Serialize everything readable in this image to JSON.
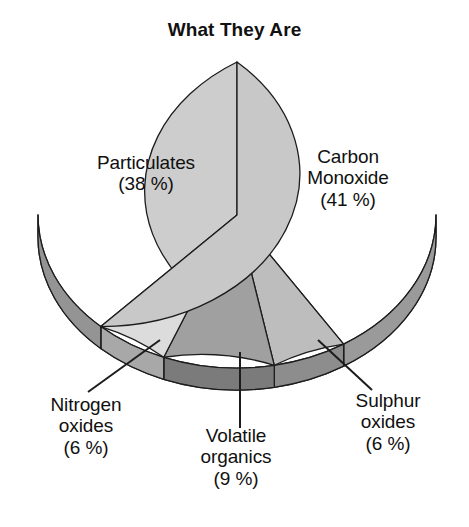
{
  "chart_data": {
    "type": "pie",
    "title": "What They Are",
    "xlabel": "",
    "ylabel": "",
    "legend_position": "none",
    "grid": false,
    "three_d": true,
    "start_angle_deg": 90,
    "direction": "clockwise",
    "categories": [
      "Carbon Monoxide",
      "Sulphur oxides",
      "Volatile organics",
      "Nitrogen oxides",
      "Particulates"
    ],
    "values": [
      41,
      6,
      9,
      6,
      38
    ],
    "value_unit": "%",
    "slices": [
      {
        "name": "Carbon Monoxide",
        "label_lines": "Carbon\nMonoxide\n(41 %)",
        "value": 41,
        "percent_text": "(41 %)",
        "top_color": "#cdcdcd",
        "side_color": "#9a9a9a",
        "label_placement": "inside"
      },
      {
        "name": "Sulphur oxides",
        "label_lines": "Sulphur\noxides\n(6 %)",
        "value": 6,
        "percent_text": "(6 %)",
        "top_color": "#bdbdbd",
        "side_color": "#8d8d8d",
        "label_placement": "outside-leader"
      },
      {
        "name": "Volatile organics",
        "label_lines": "Volatile\norganics\n(9 %)",
        "value": 9,
        "percent_text": "(9 %)",
        "top_color": "#a0a0a0",
        "side_color": "#7b7b7b",
        "label_placement": "outside-leader"
      },
      {
        "name": "Nitrogen oxides",
        "label_lines": "Nitrogen\noxides\n(6 %)",
        "value": 6,
        "percent_text": "(6 %)",
        "top_color": "#dcdcdc",
        "side_color": "#a8a8a8",
        "label_placement": "outside-leader"
      },
      {
        "name": "Particulates",
        "label_lines": "Particulates\n(38 %)",
        "value": 38,
        "percent_text": "(38 %)",
        "top_color": "#c8c8c8",
        "side_color": "#949494",
        "label_placement": "inside"
      }
    ],
    "colors": {
      "outline": "#1c1c1c",
      "background": "#ffffff",
      "text": "#101010",
      "leader_line": "#1c1c1c"
    }
  }
}
